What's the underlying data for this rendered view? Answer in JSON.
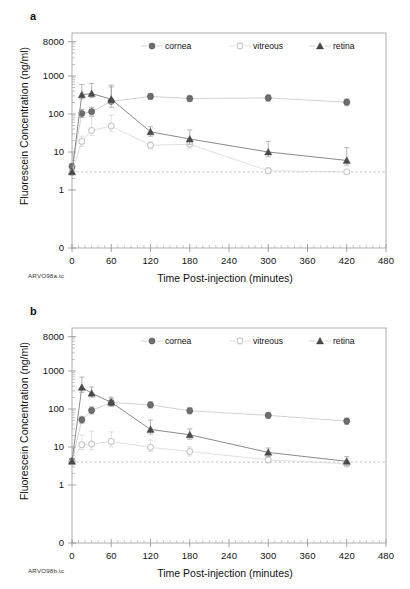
{
  "figure": {
    "panels": [
      {
        "letter": "a",
        "corner_tag": "ARVO98a.tc",
        "chart_index": 0
      },
      {
        "letter": "b",
        "corner_tag": "ARVO98b.tc",
        "chart_index": 1
      }
    ]
  },
  "chart_data": [
    {
      "type": "line",
      "panel": "a",
      "title": "",
      "xlabel": "Time Post-injection (minutes)",
      "ylabel": "Fluorescein Concentration (ng/ml)",
      "xlim": [
        0,
        480
      ],
      "xticks": [
        0,
        60,
        120,
        180,
        240,
        300,
        360,
        420,
        480
      ],
      "yscale": "log",
      "yticks": [
        0,
        1,
        10,
        100,
        1000,
        8000
      ],
      "ytick_labels": [
        "0",
        "1",
        "10",
        "100",
        "1000",
        "8000"
      ],
      "ylim": [
        1,
        8000
      ],
      "grid": false,
      "legend_position": "top-center",
      "detection_limit": 3.0,
      "x": [
        0,
        15,
        30,
        60,
        120,
        180,
        300,
        420
      ],
      "series": [
        {
          "name": "cornea",
          "marker": "filled-circle",
          "values": [
            4.2,
            103,
            115,
            215,
            290,
            255,
            265,
            205
          ],
          "err_low": [
            0.6,
            22,
            28,
            65,
            50,
            45,
            50,
            40
          ],
          "err_high": [
            0.7,
            28,
            35,
            300,
            60,
            55,
            55,
            45
          ]
        },
        {
          "name": "vitreous",
          "marker": "open-circle",
          "values": [
            2.9,
            19,
            37,
            48,
            15,
            16,
            3.2,
            3.0
          ],
          "err_low": [
            0.4,
            5,
            10,
            13,
            3,
            4,
            0.5,
            0.4
          ],
          "err_high": [
            0.4,
            7,
            55,
            45,
            4,
            5,
            0.6,
            0.5
          ]
        },
        {
          "name": "retina",
          "marker": "filled-triangle",
          "values": [
            3.0,
            320,
            345,
            245,
            34,
            22,
            10,
            6
          ],
          "err_low": [
            0.4,
            70,
            75,
            55,
            8,
            6,
            2.5,
            1.5
          ],
          "err_high": [
            0.4,
            280,
            290,
            330,
            12,
            16,
            9,
            7
          ]
        }
      ]
    },
    {
      "type": "line",
      "panel": "b",
      "title": "",
      "xlabel": "Time Post-injection (minutes)",
      "ylabel": "Fluorescein Concentration (ng/ml)",
      "xlim": [
        0,
        480
      ],
      "xticks": [
        0,
        60,
        120,
        180,
        240,
        300,
        360,
        420,
        480
      ],
      "yscale": "log",
      "yticks": [
        0,
        1,
        10,
        100,
        1000,
        8000
      ],
      "ytick_labels": [
        "0",
        "1",
        "10",
        "100",
        "1000",
        "8000"
      ],
      "ylim": [
        1,
        8000
      ],
      "grid": false,
      "legend_position": "top-center",
      "detection_limit": 4.0,
      "x": [
        0,
        15,
        30,
        60,
        120,
        180,
        300,
        420
      ],
      "series": [
        {
          "name": "cornea",
          "marker": "filled-circle",
          "values": [
            4.3,
            52,
            92,
            148,
            128,
            90,
            68,
            48
          ],
          "err_low": [
            0.5,
            10,
            18,
            30,
            22,
            16,
            12,
            9
          ],
          "err_high": [
            0.5,
            12,
            22,
            42,
            28,
            20,
            14,
            10
          ]
        },
        {
          "name": "vitreous",
          "marker": "open-circle",
          "values": [
            4.0,
            11.5,
            12,
            14,
            9.8,
            7.6,
            4.6,
            3.6
          ],
          "err_low": [
            0.4,
            3,
            3.5,
            4,
            2.2,
            1.8,
            0.8,
            0.6
          ],
          "err_high": [
            0.4,
            9,
            14,
            11,
            5.5,
            2.5,
            1.0,
            0.8
          ]
        },
        {
          "name": "retina",
          "marker": "filled-triangle",
          "values": [
            4.2,
            370,
            260,
            150,
            29,
            21,
            7.2,
            4.2
          ],
          "err_low": [
            0.5,
            95,
            55,
            30,
            7,
            5,
            1.6,
            0.9
          ],
          "err_high": [
            0.5,
            320,
            120,
            55,
            22,
            9,
            2.2,
            1.4
          ]
        }
      ]
    }
  ],
  "legend": {
    "items": [
      {
        "label": "cornea",
        "marker": "filled-circle"
      },
      {
        "label": "vitreous",
        "marker": "open-circle"
      },
      {
        "label": "retina",
        "marker": "filled-triangle"
      }
    ]
  },
  "colors": {
    "cornea": "#6e6e6e",
    "vitreous": "#c9c9c9",
    "retina": "#4a4a4a",
    "axis": "#9a9a9a",
    "text": "#111111",
    "detection_line": "#bdbdbd",
    "connector_light": "#cfcfcf"
  }
}
